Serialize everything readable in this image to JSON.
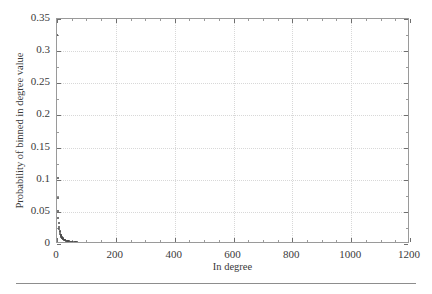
{
  "figure": {
    "background_color": "#ffffff",
    "frame_color": "#9a9a9a",
    "grid_color": "#d8d8d8",
    "marker_color": "#4a4a4a",
    "has_bottom_rule": true
  },
  "chart_data": {
    "type": "scatter",
    "title": "",
    "xlabel": "In degree",
    "ylabel": "Probability of binned in degree value",
    "xlim": [
      0,
      1200
    ],
    "ylim": [
      0,
      0.35
    ],
    "grid": true,
    "legend": null,
    "xticks": [
      0,
      200,
      400,
      600,
      800,
      1000,
      1200
    ],
    "xticklabels": [
      "0",
      "200",
      "400",
      "600",
      "800",
      "1000",
      "1200"
    ],
    "yticks": [
      0,
      0.05,
      0.1,
      0.15,
      0.2,
      0.25,
      0.3,
      0.35
    ],
    "yticklabels": [
      "0",
      "0.05",
      "0.1",
      "0.15",
      "0.2",
      "0.25",
      "0.3",
      "0.35"
    ],
    "xminorticks": [
      50,
      100,
      150,
      250,
      300,
      350,
      450,
      500,
      550,
      650,
      700,
      750,
      850,
      900,
      950,
      1050,
      1100,
      1150
    ],
    "yminorticks": [
      0.025,
      0.075,
      0.125,
      0.175,
      0.225,
      0.275,
      0.325
    ],
    "series": [
      {
        "name": "in-degree distribution",
        "marker": "dot",
        "color": "#4a4a4a",
        "x": [
          1,
          2,
          3,
          4,
          5,
          6,
          7,
          8,
          9,
          10,
          11,
          12,
          13,
          14,
          15,
          16,
          17,
          18,
          19,
          20,
          22,
          24,
          26,
          28,
          30,
          33,
          36,
          39,
          42,
          45,
          48,
          52,
          56,
          60,
          65,
          70,
          75,
          80,
          85,
          90,
          96,
          102,
          110,
          118,
          126,
          134,
          142,
          150,
          160,
          170,
          180,
          190,
          200,
          215,
          230,
          245,
          260,
          275,
          290,
          305,
          320,
          340,
          360,
          380,
          400,
          420,
          440,
          460,
          480,
          500,
          525,
          550,
          575,
          600,
          630,
          660,
          690,
          720,
          750,
          790,
          830,
          870,
          910,
          950,
          990,
          1030,
          1070,
          1110,
          1150
        ],
        "y": [
          0.3255,
          0.102,
          0.072,
          0.051,
          0.04,
          0.0325,
          0.027,
          0.0232,
          0.0203,
          0.018,
          0.0162,
          0.0147,
          0.0134,
          0.0123,
          0.0114,
          0.0106,
          0.0099,
          0.0093,
          0.0088,
          0.0083,
          0.0075,
          0.0068,
          0.0063,
          0.0058,
          0.0054,
          0.0049,
          0.0045,
          0.0042,
          0.0039,
          0.0036,
          0.0034,
          0.0031,
          0.0029,
          0.0027,
          0.0025,
          0.0023,
          0.0021,
          0.002,
          0.0019,
          0.0018,
          0.0017,
          0.0016,
          0.0015,
          0.0014,
          0.0013,
          0.0012,
          0.0011,
          0.0011,
          0.001,
          0.00095,
          0.0009,
          0.00085,
          0.0008,
          0.00075,
          0.0007,
          0.00065,
          0.0006,
          0.00058,
          0.00055,
          0.00052,
          0.0005,
          0.00047,
          0.00044,
          0.00042,
          0.0004,
          0.00038,
          0.00036,
          0.00034,
          0.00033,
          0.00032,
          0.0003,
          0.00029,
          0.00028,
          0.00027,
          0.00025,
          0.00024,
          0.00023,
          0.00022,
          0.00021,
          0.0002,
          0.00019,
          0.00018,
          0.00017,
          0.00016,
          0.00015,
          0.00014,
          0.00013,
          0.00013,
          0.00012
        ]
      }
    ],
    "outlier_points": [
      {
        "x": 1,
        "y": 0.3255
      },
      {
        "x": 2,
        "y": 0.102
      },
      {
        "x": 3,
        "y": 0.072
      }
    ]
  }
}
